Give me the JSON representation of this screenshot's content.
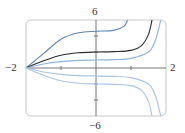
{
  "chart_data": {
    "type": "line",
    "title": "",
    "xlabel": "",
    "ylabel": "",
    "xlim": [
      -2,
      2
    ],
    "ylim": [
      -6,
      6
    ],
    "grid": false,
    "legend": null,
    "axis_labels": {
      "x_min": "−2",
      "x_max": "2",
      "y_max": "6",
      "y_min": "−6"
    },
    "x_ticks": [
      -1,
      0,
      1
    ],
    "y_ticks": [
      -4,
      -2,
      0,
      2,
      4
    ],
    "series": [
      {
        "name": "curve-1",
        "color": "#5b86b8",
        "x": [
          -2,
          -1.5,
          -1,
          -0.5,
          0,
          0.5,
          0.8,
          0.9
        ],
        "y": [
          0,
          1.8,
          3.6,
          4.4,
          4.6,
          4.7,
          5.2,
          6
        ]
      },
      {
        "name": "curve-2",
        "color": "#2b2b2b",
        "x": [
          -2,
          -1.5,
          -1,
          -0.5,
          0,
          0.5,
          1,
          1.3,
          1.5,
          1.6
        ],
        "y": [
          0,
          0.9,
          1.6,
          1.9,
          2.0,
          2.05,
          2.2,
          2.8,
          4.2,
          6
        ]
      },
      {
        "name": "curve-3",
        "color": "#8fb3d9",
        "x": [
          -2,
          -1.5,
          -1,
          -0.5,
          0,
          0.5,
          1,
          1.5,
          1.7,
          1.85
        ],
        "y": [
          0,
          0.5,
          0.8,
          0.95,
          1.0,
          1.05,
          1.2,
          2.0,
          3.5,
          6
        ]
      },
      {
        "name": "curve-4",
        "color": "#a9c6e4",
        "x": [
          -2,
          -1.5,
          -1,
          -0.5,
          0,
          0.5,
          1,
          1.5,
          1.7,
          1.85
        ],
        "y": [
          0,
          -0.5,
          -0.8,
          -0.95,
          -1.0,
          -1.05,
          -1.2,
          -2.0,
          -3.5,
          -6
        ]
      },
      {
        "name": "curve-5",
        "color": "#a9c6e4",
        "x": [
          -2,
          -1.5,
          -1,
          -0.5,
          0,
          0.5,
          1,
          1.3,
          1.5,
          1.6
        ],
        "y": [
          0,
          -0.9,
          -1.6,
          -1.9,
          -2.0,
          -2.05,
          -2.2,
          -2.8,
          -4.2,
          -6
        ]
      }
    ]
  }
}
